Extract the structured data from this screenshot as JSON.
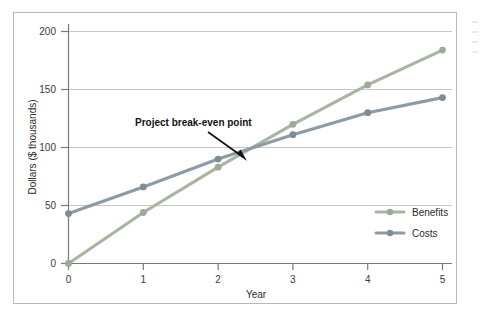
{
  "chart_data": {
    "type": "line",
    "title": "",
    "xlabel": "Year",
    "ylabel": "Dollars ($ thousands)",
    "x": [
      0,
      1,
      2,
      3,
      4,
      5
    ],
    "xticklabels": [
      "0",
      "1",
      "2",
      "3",
      "4",
      "5"
    ],
    "yticks": [
      0,
      50,
      100,
      150,
      200
    ],
    "yticklabels": [
      "0",
      "50",
      "100",
      "150",
      "200"
    ],
    "xlim": [
      0,
      5
    ],
    "ylim": [
      0,
      210
    ],
    "grid": "horizontal",
    "legend_position": "lower-right",
    "series": [
      {
        "name": "Benefits",
        "color": "#a9b5a3",
        "values": [
          0,
          44,
          83,
          120,
          154,
          184
        ]
      },
      {
        "name": "Costs",
        "color": "#8e9aa6",
        "values": [
          43,
          66,
          90,
          111,
          130,
          143
        ]
      }
    ],
    "annotations": [
      {
        "text": "Project break-even point",
        "points_to_x": 2.42,
        "points_to_y": 99
      }
    ]
  },
  "axis": {
    "y_label": "Dollars ($ thousands)",
    "x_label": "Year",
    "y_ticks": [
      "200",
      "150",
      "100",
      "50",
      "0"
    ],
    "x_ticks": [
      "0",
      "1",
      "2",
      "3",
      "4",
      "5"
    ]
  },
  "legend": {
    "entries": [
      {
        "label": "Benefits"
      },
      {
        "label": "Costs"
      }
    ]
  },
  "annotation": {
    "breakeven_text": "Project break-even point"
  },
  "colors": {
    "benefits": "#a9b5a3",
    "costs": "#8e9aa6",
    "grid": "#c7c7c7",
    "axis": "#7a7a7a",
    "frame": "#b9b9b9"
  }
}
